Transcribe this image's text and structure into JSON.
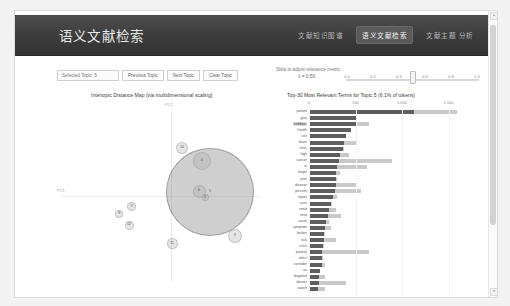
{
  "app": {
    "brand": "语义文献检索",
    "nav": [
      {
        "label": "文献知识图谱",
        "active": false
      },
      {
        "label": "语义文献检索",
        "active": true
      },
      {
        "label": "文献主题 分析",
        "active": false
      }
    ]
  },
  "controls": {
    "selected_topic_label": "Selected Topic: 5",
    "previous_topic": "Previous Topic",
    "next_topic": "Next Topic",
    "clear_topic": "Clear Topic"
  },
  "slider": {
    "label": "Slide to adjust relevance metric:",
    "lambda_symbol": "λ",
    "value_text": "λ = 0.50",
    "value": 0.5,
    "ticks": [
      "0.0",
      "0.2",
      "0.4",
      "0.6",
      "0.8",
      "1.0"
    ]
  },
  "panels": {
    "mds_title": "Intertopic Distance Map (via multidimensional scaling)",
    "bar_title": "Top-30 Most Relevant Terms for Topic 5 (6.1% of tokens)"
  },
  "chart_data": [
    {
      "type": "scatter",
      "title": "Intertopic Distance Map (via multidimensional scaling)",
      "xlabel": "PC1",
      "ylabel": "PC2",
      "xlim": [
        -0.35,
        0.35
      ],
      "ylim": [
        -0.35,
        0.35
      ],
      "grid": false,
      "selected_topic": 5,
      "points": [
        {
          "topic": 5,
          "x": 0.115,
          "y": 0.015,
          "size": 86,
          "selected": true
        },
        {
          "topic": 4,
          "x": 0.09,
          "y": 0.11,
          "size": 16,
          "selected": false
        },
        {
          "topic": 6,
          "x": 0.082,
          "y": 0.018,
          "size": 11,
          "selected": false
        },
        {
          "topic": 1,
          "x": 0.1,
          "y": -0.002,
          "size": 5,
          "selected": false
        },
        {
          "topic": 3,
          "x": 0.19,
          "y": -0.118,
          "size": 12,
          "selected": false
        },
        {
          "topic": 10,
          "x": 0.03,
          "y": 0.148,
          "size": 10,
          "selected": false
        },
        {
          "topic": 11,
          "x": 0.0,
          "y": -0.142,
          "size": 9,
          "selected": false
        },
        {
          "topic": 8,
          "x": -0.16,
          "y": -0.052,
          "size": 6,
          "selected": false
        },
        {
          "topic": 9,
          "x": -0.122,
          "y": -0.03,
          "size": 7,
          "selected": false
        },
        {
          "topic": 12,
          "x": -0.13,
          "y": -0.085,
          "size": 7,
          "selected": false
        }
      ]
    },
    {
      "type": "bar",
      "orientation": "horizontal",
      "title": "Top-30 Most Relevant Terms for Topic 5 (6.1% of tokens)",
      "xlabel": "",
      "ylabel": "",
      "xlim": [
        0,
        2000
      ],
      "xticks": [
        0,
        500,
        1000,
        1500,
        2000
      ],
      "xticklabels": [
        "0",
        "500",
        "1,000",
        "1,500",
        "2,000"
      ],
      "grid": false,
      "legend": [
        "Overall term frequency",
        "Estimated term frequency within the selected topic"
      ],
      "highlight_term": "children",
      "categories": [
        "patient",
        "give",
        "children",
        "health",
        "can",
        "share",
        "clinic",
        "high",
        "cancer",
        "in",
        "forget",
        "year",
        "disease",
        "percent",
        "report",
        "case",
        "need",
        "treat",
        "cause",
        "symptom",
        "before",
        "sick",
        "crisis",
        "particip",
        "infect",
        "consider",
        "ex",
        "diagnost",
        "decent",
        "watch"
      ],
      "series": [
        {
          "name": "Estimated term frequency within the selected topic",
          "values": [
            1130,
            510,
            520,
            450,
            395,
            375,
            370,
            330,
            325,
            300,
            295,
            290,
            285,
            280,
            255,
            240,
            215,
            200,
            185,
            175,
            165,
            160,
            150,
            145,
            140,
            135,
            118,
            112,
            108,
            100
          ]
        },
        {
          "name": "Overall term frequency",
          "values": [
            1590,
            520,
            640,
            455,
            400,
            500,
            375,
            430,
            890,
            620,
            330,
            300,
            520,
            560,
            300,
            245,
            290,
            340,
            220,
            240,
            175,
            290,
            165,
            640,
            155,
            170,
            120,
            175,
            400,
            175
          ]
        }
      ]
    }
  ],
  "scrollbar": {
    "up_arrow": "▲",
    "down_arrow": "▼"
  }
}
